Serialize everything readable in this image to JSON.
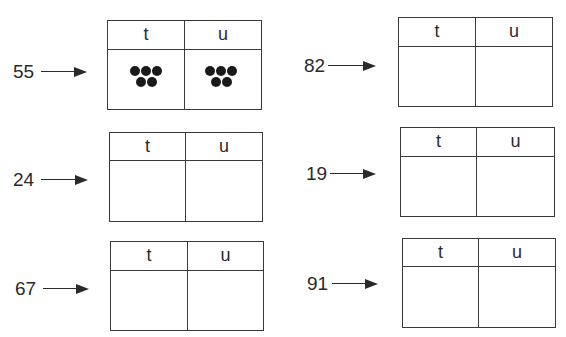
{
  "worksheet": {
    "column_labels": {
      "tens": "t",
      "units": "u"
    },
    "items": [
      {
        "number": "55",
        "tens_dots": 5,
        "units_dots": 5
      },
      {
        "number": "82"
      },
      {
        "number": "24"
      },
      {
        "number": "19"
      },
      {
        "number": "67"
      },
      {
        "number": "91"
      }
    ]
  }
}
